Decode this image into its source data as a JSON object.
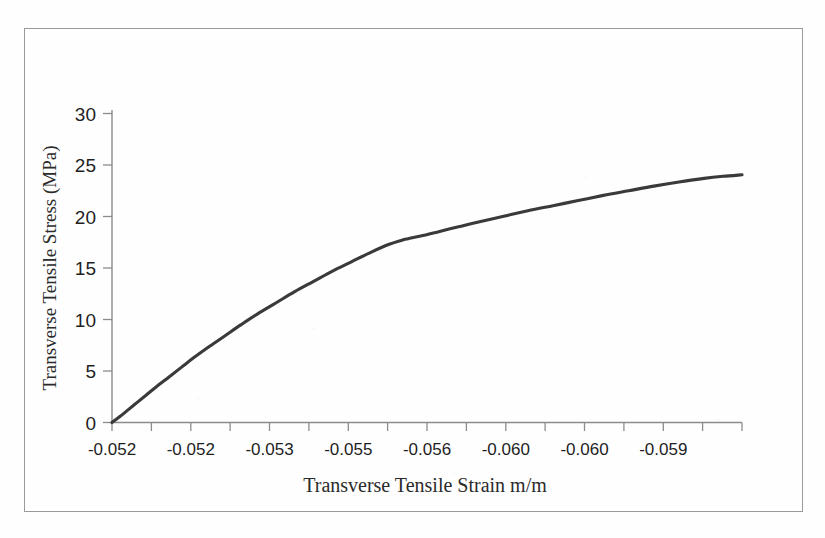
{
  "figure": {
    "border_color": "#9a9a9a",
    "background": "#fefefe"
  },
  "chart_data": {
    "type": "line",
    "title": "",
    "xlabel": "Transverse Tensile Strain m/m",
    "ylabel": "Transverse Tensile Stress (MPa)",
    "line_color": "#3a3a3a",
    "axis_color": "#8c8c8c",
    "grid": false,
    "legend": null,
    "ylim": [
      0,
      30
    ],
    "yticks": [
      0,
      5,
      10,
      15,
      20,
      25,
      30
    ],
    "ytick_labels": [
      "0",
      "5",
      "10",
      "15",
      "20",
      "25",
      "30"
    ],
    "xtick_labels": [
      "-0.052",
      "-0.052",
      "-0.053",
      "-0.055",
      "-0.056",
      "-0.060",
      "-0.060",
      "-0.059"
    ],
    "xtick_minor_count": 16,
    "x_axis_note": "x tick labels are strain values printed at every other tick; axis index runs left to right",
    "series": [
      {
        "name": "Transverse tensile stress-strain",
        "x_index": [
          0.0,
          0.012,
          0.025,
          0.04,
          0.055,
          0.07,
          0.09,
          0.11,
          0.13,
          0.155,
          0.18,
          0.205,
          0.23,
          0.26,
          0.29,
          0.32,
          0.35,
          0.38,
          0.41,
          0.44,
          0.46,
          0.47,
          0.49,
          0.52,
          0.55,
          0.58,
          0.62,
          0.66,
          0.7,
          0.74,
          0.78,
          0.82,
          0.86,
          0.9,
          0.94,
          0.97,
          1.0
        ],
        "values": [
          0.0,
          0.55,
          1.2,
          1.95,
          2.7,
          3.45,
          4.4,
          5.35,
          6.3,
          7.4,
          8.45,
          9.5,
          10.5,
          11.6,
          12.7,
          13.7,
          14.7,
          15.6,
          16.5,
          17.3,
          17.7,
          17.85,
          18.1,
          18.55,
          19.0,
          19.45,
          20.0,
          20.55,
          21.05,
          21.55,
          22.05,
          22.5,
          22.95,
          23.35,
          23.7,
          23.9,
          24.05
        ]
      }
    ],
    "knee_point": {
      "x_index": 0.46,
      "value": 17.7
    },
    "end_point": {
      "x_index": 1.0,
      "value": 24.05
    }
  }
}
